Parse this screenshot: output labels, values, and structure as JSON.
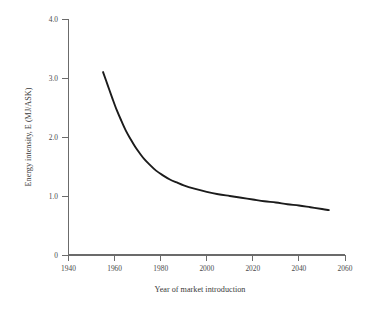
{
  "chart_data": {
    "type": "line",
    "title": "",
    "xlabel": "Year of market introduction",
    "ylabel": "Energy intensity, E (MJ/ASK)",
    "xlim": [
      1940,
      2060
    ],
    "ylim": [
      0,
      4.0
    ],
    "grid": false,
    "legend": null,
    "xticks": [
      1940,
      1960,
      1980,
      2000,
      2020,
      2040,
      2060
    ],
    "xtick_labels": [
      "1940",
      "1960",
      "1980",
      "2000",
      "2020",
      "2040",
      "2060"
    ],
    "yticks": [
      0,
      1.0,
      2.0,
      3.0,
      4.0
    ],
    "ytick_labels": [
      "0",
      "1.0",
      "2.0",
      "3.0",
      "4.0"
    ],
    "series": [
      {
        "name": "Energy intensity trend",
        "color": "#1b1b1b",
        "x": [
          1955,
          1957,
          1959,
          1961,
          1963,
          1965,
          1967,
          1969,
          1971,
          1973,
          1975,
          1978,
          1981,
          1984,
          1987,
          1990,
          1995,
          2000,
          2005,
          2010,
          2015,
          2020,
          2025,
          2030,
          2035,
          2040,
          2045,
          2050,
          2053
        ],
        "values": [
          3.1,
          2.88,
          2.66,
          2.45,
          2.27,
          2.1,
          1.96,
          1.83,
          1.72,
          1.62,
          1.54,
          1.43,
          1.35,
          1.28,
          1.23,
          1.18,
          1.12,
          1.07,
          1.03,
          1.0,
          0.97,
          0.94,
          0.91,
          0.89,
          0.86,
          0.84,
          0.81,
          0.78,
          0.76
        ]
      }
    ]
  },
  "axes": {
    "y_title": "Energy intensity, E (MJ/ASK)",
    "x_title": "Year of market introduction",
    "y_labels": {
      "l0": "0",
      "l1": "1.0",
      "l2": "2.0",
      "l3": "3.0",
      "l4": "4.0"
    },
    "x_labels": {
      "t1940": "1940",
      "t1960": "1960",
      "t1980": "1980",
      "t2000": "2000",
      "t2020": "2020",
      "t2040": "2040",
      "t2060": "2060"
    }
  }
}
